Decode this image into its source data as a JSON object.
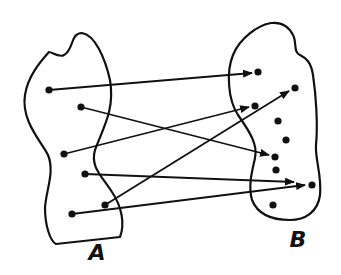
{
  "diagram": {
    "type": "mapping",
    "sets": [
      {
        "id": "A",
        "label": "A",
        "label_pos": [
          97,
          260
        ],
        "outline": "M49,52 C42,60 28,75 25,95 C21,120 40,140 48,155 C55,172 46,190 45,208 C45,225 50,241 56,244 L120,237 C125,224 122,207 112,192 C102,176 90,167 95,150 C103,128 115,110 110,80 C105,58 95,35 82,33 C70,33 74,50 64,55 C59,58 52,52 49,52 Z",
        "points": [
          [
            49,
            90
          ],
          [
            81,
            107
          ],
          [
            64,
            154
          ],
          [
            85,
            174
          ],
          [
            105,
            205
          ],
          [
            72,
            214
          ]
        ]
      },
      {
        "id": "B",
        "label": "B",
        "label_pos": [
          298,
          247
        ],
        "outline": "M271,23 C258,25 240,38 233,55 C226,72 228,100 238,115 C250,132 258,145 255,158 C252,172 248,185 252,200 C258,215 272,220 290,220 C305,220 318,212 320,195 C322,175 315,160 316,145 C318,125 316,95 313,75 C311,62 306,58 300,55 C293,52 297,42 293,35 C288,25 280,22 271,23 Z",
        "points": [
          [
            258,
            72
          ],
          [
            295,
            88
          ],
          [
            255,
            106
          ],
          [
            278,
            121
          ],
          [
            286,
            140
          ],
          [
            275,
            157
          ],
          [
            276,
            170
          ],
          [
            312,
            185
          ],
          [
            273,
            205
          ]
        ]
      }
    ],
    "arrows": [
      {
        "from": [
          49,
          90
        ],
        "to": [
          252,
          73
        ]
      },
      {
        "from": [
          81,
          107
        ],
        "to": [
          269,
          155
        ]
      },
      {
        "from": [
          64,
          154
        ],
        "to": [
          249,
          107
        ]
      },
      {
        "from": [
          85,
          174
        ],
        "to": [
          294,
          182
        ]
      },
      {
        "from": [
          105,
          205
        ],
        "to": [
          289,
          91
        ]
      },
      {
        "from": [
          72,
          214
        ],
        "to": [
          305,
          185
        ]
      }
    ],
    "colors": {
      "stroke": "#111111",
      "background": "#ffffff"
    }
  }
}
